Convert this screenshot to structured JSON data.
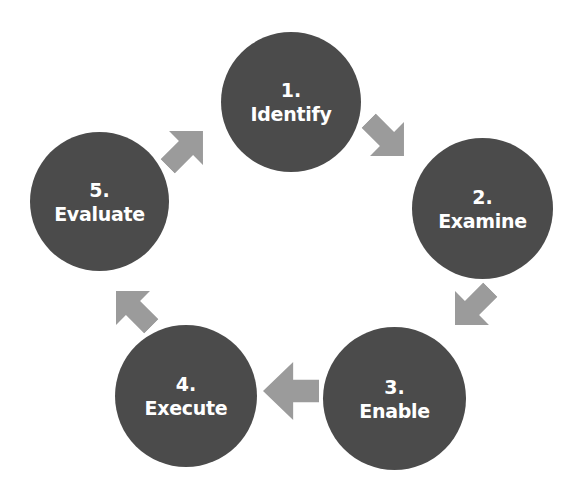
{
  "diagram": {
    "type": "cycle",
    "colors": {
      "circle": "#4b4b4b",
      "arrow": "#9b9b9b",
      "text": "#ffffff",
      "background": "#ffffff"
    },
    "steps": [
      {
        "number": "1.",
        "label": "Identify"
      },
      {
        "number": "2.",
        "label": "Examine"
      },
      {
        "number": "3.",
        "label": "Enable"
      },
      {
        "number": "4.",
        "label": "Execute"
      },
      {
        "number": "5.",
        "label": "Evaluate"
      }
    ],
    "arrows": [
      {
        "from": "1",
        "to": "2",
        "direction": "down-right"
      },
      {
        "from": "2",
        "to": "3",
        "direction": "down-left"
      },
      {
        "from": "3",
        "to": "4",
        "direction": "left"
      },
      {
        "from": "4",
        "to": "5",
        "direction": "up-left"
      },
      {
        "from": "5",
        "to": "1",
        "direction": "up-right"
      }
    ]
  }
}
